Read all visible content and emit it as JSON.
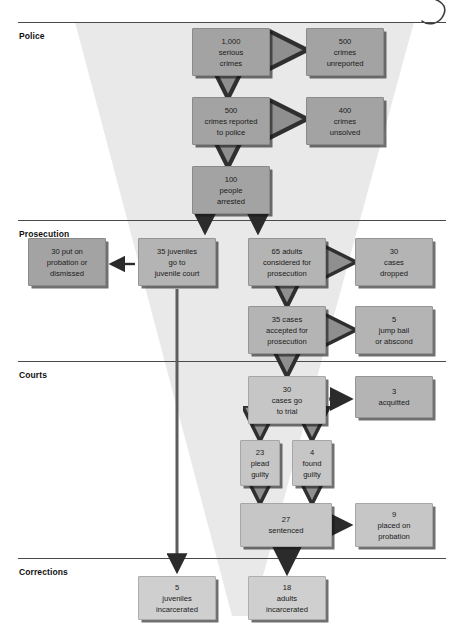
{
  "sections": [
    {
      "id": "police",
      "label": "Police",
      "rule_y": 22,
      "label_y": 31
    },
    {
      "id": "prosecution",
      "label": "Prosecution",
      "rule_y": 220,
      "label_y": 229
    },
    {
      "id": "courts",
      "label": "Courts",
      "rule_y": 361,
      "label_y": 370
    },
    {
      "id": "corrections",
      "label": "Corrections",
      "rule_y": 558,
      "label_y": 567
    }
  ],
  "nodes": [
    {
      "id": "serious-crimes",
      "lines": [
        "1,000",
        "serious",
        "crimes"
      ],
      "x": 192,
      "y": 28,
      "w": 78,
      "h": 48,
      "tone": "dark"
    },
    {
      "id": "crimes-unreported",
      "lines": [
        "500",
        "crimes",
        "unreported"
      ],
      "x": 306,
      "y": 28,
      "w": 78,
      "h": 48,
      "tone": "dark"
    },
    {
      "id": "crimes-reported",
      "lines": [
        "500",
        "crimes reported",
        "to police"
      ],
      "x": 192,
      "y": 97,
      "w": 78,
      "h": 48,
      "tone": "dark"
    },
    {
      "id": "crimes-unsolved",
      "lines": [
        "400",
        "crimes",
        "unsolved"
      ],
      "x": 306,
      "y": 97,
      "w": 78,
      "h": 48,
      "tone": "dark"
    },
    {
      "id": "people-arrested",
      "lines": [
        "100",
        "people",
        "arrested"
      ],
      "x": 192,
      "y": 166,
      "w": 78,
      "h": 48,
      "tone": "dark"
    },
    {
      "id": "probation-dismissed",
      "lines": [
        "30 put on",
        "probation or",
        "dismissed"
      ],
      "x": 28,
      "y": 238,
      "w": 78,
      "h": 48,
      "tone": "dark"
    },
    {
      "id": "juvenile-court",
      "lines": [
        "35 juveniles",
        "go to",
        "juvenile court"
      ],
      "x": 138,
      "y": 238,
      "w": 78,
      "h": 48,
      "tone": "mid"
    },
    {
      "id": "adults-considered",
      "lines": [
        "65 adults",
        "considered for",
        "prosecution"
      ],
      "x": 248,
      "y": 238,
      "w": 78,
      "h": 48,
      "tone": "mid"
    },
    {
      "id": "cases-dropped",
      "lines": [
        "30",
        "cases",
        "dropped"
      ],
      "x": 355,
      "y": 238,
      "w": 78,
      "h": 48,
      "tone": "mid"
    },
    {
      "id": "cases-accepted",
      "lines": [
        "35 cases",
        "accepted for",
        "prosecution"
      ],
      "x": 248,
      "y": 306,
      "w": 78,
      "h": 48,
      "tone": "mid"
    },
    {
      "id": "jump-bail",
      "lines": [
        "5",
        "jump bail",
        "or abscond"
      ],
      "x": 355,
      "y": 306,
      "w": 78,
      "h": 48,
      "tone": "mid"
    },
    {
      "id": "cases-go-to-trial",
      "lines": [
        "30",
        "cases go",
        "to trial"
      ],
      "x": 248,
      "y": 376,
      "w": 78,
      "h": 48,
      "tone": "light"
    },
    {
      "id": "acquitted",
      "lines": [
        "3",
        "acquitted"
      ],
      "x": 355,
      "y": 376,
      "w": 78,
      "h": 42,
      "tone": "mid"
    },
    {
      "id": "plead-guilty",
      "lines": [
        "23",
        "plead",
        "guilty"
      ],
      "x": 240,
      "y": 440,
      "w": 40,
      "h": 46,
      "tone": "light"
    },
    {
      "id": "found-guilty",
      "lines": [
        "4",
        "found",
        "guilty"
      ],
      "x": 292,
      "y": 440,
      "w": 40,
      "h": 46,
      "tone": "light"
    },
    {
      "id": "sentenced",
      "lines": [
        "27",
        "sentenced"
      ],
      "x": 240,
      "y": 503,
      "w": 92,
      "h": 44,
      "tone": "light"
    },
    {
      "id": "placed-on-probation",
      "lines": [
        "9",
        "placed on",
        "probation"
      ],
      "x": 355,
      "y": 503,
      "w": 78,
      "h": 44,
      "tone": "light"
    },
    {
      "id": "juveniles-incarcerated",
      "lines": [
        "5",
        "juveniles",
        "incarcerated"
      ],
      "x": 138,
      "y": 576,
      "w": 78,
      "h": 44,
      "tone": "pale"
    },
    {
      "id": "adults-incarcerated",
      "lines": [
        "18",
        "adults",
        "incarcerated"
      ],
      "x": 248,
      "y": 576,
      "w": 78,
      "h": 44,
      "tone": "pale"
    }
  ],
  "colors": {
    "page_background": "#ffffff",
    "funnel_fill": "#e8e8e8",
    "rule": "#4a4a4a",
    "box_dark": "#a8a8a8",
    "box_mid": "#b4b4b4",
    "box_light": "#c6c6c6",
    "box_pale": "#cfcfcf",
    "box_shadow": "#1e1e1e",
    "arrow_dark": "#2b2b2b",
    "arrow_grey": "#9a9a9a",
    "text": "#1a1a1a"
  }
}
